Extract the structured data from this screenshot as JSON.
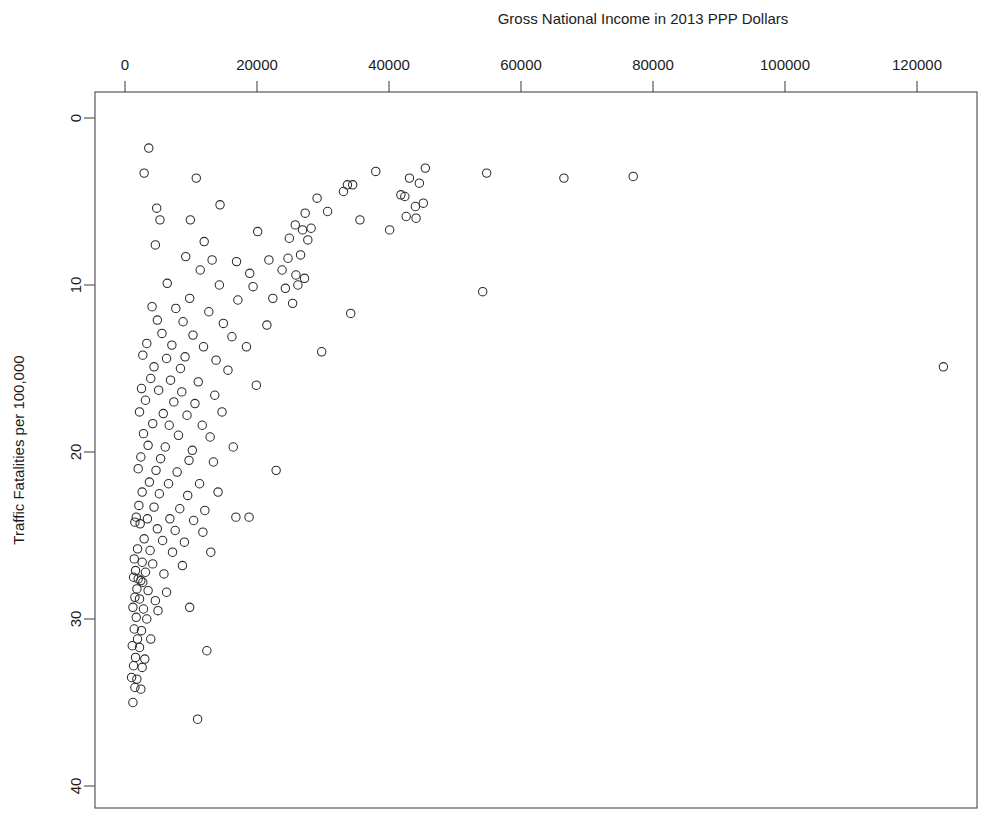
{
  "chart_data": {
    "type": "scatter",
    "title": "",
    "xlabel": "Gross National Income in 2013 PPP Dollars",
    "ylabel": "Traffic Fatalities per 100,000",
    "xlim": [
      -3500,
      129000
    ],
    "ylim": [
      -1.5,
      41.5
    ],
    "y_axis_reversed": true,
    "grid": false,
    "legend": null,
    "xticks": [
      0,
      20000,
      40000,
      60000,
      80000,
      100000,
      120000
    ],
    "xtick_labels": [
      "0",
      "20000",
      "40000",
      "60000",
      "80000",
      "100000",
      "120000"
    ],
    "yticks": [
      0,
      10,
      20,
      30,
      40
    ],
    "ytick_labels": [
      "0",
      "10",
      "20",
      "30",
      "40"
    ],
    "marker": "open-circle",
    "marker_color": "#2b2b2b",
    "marker_size": 4.2,
    "points": [
      [
        3600,
        1.8
      ],
      [
        2900,
        3.3
      ],
      [
        10800,
        3.6
      ],
      [
        38000,
        3.2
      ],
      [
        45500,
        3.0
      ],
      [
        54800,
        3.3
      ],
      [
        66500,
        3.6
      ],
      [
        77000,
        3.5
      ],
      [
        33700,
        4.0
      ],
      [
        34500,
        4.0
      ],
      [
        43100,
        3.6
      ],
      [
        44600,
        3.9
      ],
      [
        4800,
        5.4
      ],
      [
        14400,
        5.2
      ],
      [
        41800,
        4.6
      ],
      [
        42400,
        4.7
      ],
      [
        33100,
        4.4
      ],
      [
        29100,
        4.8
      ],
      [
        45200,
        5.1
      ],
      [
        44000,
        5.3
      ],
      [
        5300,
        6.1
      ],
      [
        9900,
        6.1
      ],
      [
        30700,
        5.6
      ],
      [
        27300,
        5.7
      ],
      [
        25800,
        6.4
      ],
      [
        42600,
        5.9
      ],
      [
        44100,
        6.0
      ],
      [
        20100,
        6.8
      ],
      [
        26900,
        6.7
      ],
      [
        28200,
        6.6
      ],
      [
        35600,
        6.1
      ],
      [
        40100,
        6.7
      ],
      [
        4600,
        7.6
      ],
      [
        12000,
        7.4
      ],
      [
        24900,
        7.2
      ],
      [
        27700,
        7.3
      ],
      [
        9200,
        8.3
      ],
      [
        13200,
        8.5
      ],
      [
        16900,
        8.6
      ],
      [
        21800,
        8.5
      ],
      [
        24700,
        8.4
      ],
      [
        26600,
        8.2
      ],
      [
        11400,
        9.1
      ],
      [
        18900,
        9.3
      ],
      [
        23800,
        9.1
      ],
      [
        25900,
        9.4
      ],
      [
        27200,
        9.6
      ],
      [
        6400,
        9.9
      ],
      [
        14300,
        10.0
      ],
      [
        19400,
        10.1
      ],
      [
        24300,
        10.2
      ],
      [
        26200,
        10.0
      ],
      [
        54200,
        10.4
      ],
      [
        9800,
        10.8
      ],
      [
        17100,
        10.9
      ],
      [
        22400,
        10.8
      ],
      [
        25400,
        11.1
      ],
      [
        4100,
        11.3
      ],
      [
        7700,
        11.4
      ],
      [
        12700,
        11.6
      ],
      [
        34200,
        11.7
      ],
      [
        4900,
        12.1
      ],
      [
        8800,
        12.2
      ],
      [
        14900,
        12.3
      ],
      [
        21500,
        12.4
      ],
      [
        5600,
        12.9
      ],
      [
        10300,
        13.0
      ],
      [
        16200,
        13.1
      ],
      [
        3300,
        13.5
      ],
      [
        7100,
        13.6
      ],
      [
        11900,
        13.7
      ],
      [
        18400,
        13.7
      ],
      [
        2700,
        14.2
      ],
      [
        6300,
        14.4
      ],
      [
        9100,
        14.3
      ],
      [
        13800,
        14.5
      ],
      [
        4400,
        14.9
      ],
      [
        8400,
        15.0
      ],
      [
        15600,
        15.1
      ],
      [
        124000,
        14.9
      ],
      [
        29800,
        14.0
      ],
      [
        3900,
        15.6
      ],
      [
        6900,
        15.7
      ],
      [
        11100,
        15.8
      ],
      [
        2500,
        16.2
      ],
      [
        5100,
        16.3
      ],
      [
        8600,
        16.4
      ],
      [
        13600,
        16.6
      ],
      [
        19900,
        16.0
      ],
      [
        3100,
        16.9
      ],
      [
        7400,
        17.0
      ],
      [
        10600,
        17.1
      ],
      [
        2200,
        17.6
      ],
      [
        5800,
        17.7
      ],
      [
        9400,
        17.8
      ],
      [
        14700,
        17.6
      ],
      [
        4200,
        18.3
      ],
      [
        6700,
        18.4
      ],
      [
        11700,
        18.4
      ],
      [
        2800,
        18.9
      ],
      [
        8100,
        19.0
      ],
      [
        12900,
        19.1
      ],
      [
        3500,
        19.6
      ],
      [
        6100,
        19.7
      ],
      [
        10200,
        19.9
      ],
      [
        16400,
        19.7
      ],
      [
        2400,
        20.3
      ],
      [
        5400,
        20.4
      ],
      [
        9700,
        20.5
      ],
      [
        13400,
        20.6
      ],
      [
        2000,
        21.0
      ],
      [
        4700,
        21.1
      ],
      [
        7900,
        21.2
      ],
      [
        22900,
        21.1
      ],
      [
        3700,
        21.8
      ],
      [
        6600,
        21.9
      ],
      [
        11300,
        21.9
      ],
      [
        2600,
        22.4
      ],
      [
        5200,
        22.5
      ],
      [
        9500,
        22.6
      ],
      [
        14100,
        22.4
      ],
      [
        2100,
        23.2
      ],
      [
        4400,
        23.3
      ],
      [
        8300,
        23.4
      ],
      [
        12100,
        23.5
      ],
      [
        1700,
        23.9
      ],
      [
        3400,
        24.0
      ],
      [
        6800,
        24.0
      ],
      [
        10400,
        24.1
      ],
      [
        16800,
        23.9
      ],
      [
        18800,
        23.9
      ],
      [
        1500,
        24.2
      ],
      [
        2300,
        24.3
      ],
      [
        4900,
        24.6
      ],
      [
        7600,
        24.7
      ],
      [
        11800,
        24.8
      ],
      [
        2900,
        25.2
      ],
      [
        5700,
        25.3
      ],
      [
        9000,
        25.4
      ],
      [
        1900,
        25.8
      ],
      [
        3800,
        25.9
      ],
      [
        7200,
        26.0
      ],
      [
        13000,
        26.0
      ],
      [
        1400,
        26.4
      ],
      [
        2600,
        26.6
      ],
      [
        4200,
        26.7
      ],
      [
        8700,
        26.8
      ],
      [
        1600,
        27.1
      ],
      [
        3100,
        27.2
      ],
      [
        5900,
        27.3
      ],
      [
        1300,
        27.5
      ],
      [
        2000,
        27.6
      ],
      [
        2400,
        27.7
      ],
      [
        2700,
        27.8
      ],
      [
        1800,
        28.2
      ],
      [
        3500,
        28.3
      ],
      [
        6300,
        28.4
      ],
      [
        1500,
        28.7
      ],
      [
        2200,
        28.8
      ],
      [
        4600,
        28.9
      ],
      [
        1200,
        29.3
      ],
      [
        2800,
        29.4
      ],
      [
        5000,
        29.5
      ],
      [
        1700,
        29.9
      ],
      [
        3300,
        30.0
      ],
      [
        9800,
        29.3
      ],
      [
        1400,
        30.6
      ],
      [
        2500,
        30.7
      ],
      [
        1900,
        31.2
      ],
      [
        3900,
        31.2
      ],
      [
        1100,
        31.6
      ],
      [
        2200,
        31.7
      ],
      [
        1600,
        32.3
      ],
      [
        3000,
        32.4
      ],
      [
        1300,
        32.8
      ],
      [
        2600,
        32.9
      ],
      [
        12400,
        31.9
      ],
      [
        1000,
        33.5
      ],
      [
        1800,
        33.6
      ],
      [
        1500,
        34.1
      ],
      [
        2400,
        34.2
      ],
      [
        1200,
        35.0
      ],
      [
        11000,
        36.0
      ]
    ]
  },
  "figure": {
    "background_color": "#ffffff",
    "frame_color": "#4a4a4a",
    "text_color": "#1b1b1b"
  }
}
